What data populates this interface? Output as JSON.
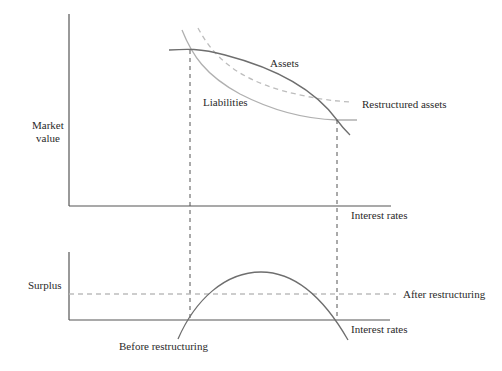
{
  "figure": {
    "type": "diagram",
    "top_panel": {
      "y_axis_label_line1": "Market",
      "y_axis_label_line2": "value",
      "x_axis_label": "Interest rates",
      "curves": {
        "assets": "Assets",
        "liabilities": "Liabilities",
        "restructured_assets": "Restructured assets"
      }
    },
    "bottom_panel": {
      "y_axis_label": "Surplus",
      "x_axis_label": "Interest rates",
      "before_label": "Before restructuring",
      "after_label": "After restructuring"
    },
    "colors": {
      "axis": "#555555",
      "assets": "#6e6e6e",
      "liabilities": "#b0b0b0",
      "restructured": "#bdbdbd",
      "guide": "#555555"
    }
  }
}
